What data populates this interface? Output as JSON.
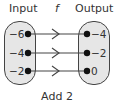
{
  "diagram": {
    "type": "mapping-diagram",
    "headers": {
      "input": "Input",
      "function": "f",
      "output": "Output"
    },
    "inputs": [
      "−6",
      "−4",
      "−2"
    ],
    "outputs": [
      "−4",
      "−2",
      "0"
    ],
    "mappings": [
      {
        "from": "−6",
        "to": "−4"
      },
      {
        "from": "−4",
        "to": "−2"
      },
      {
        "from": "−2",
        "to": "0"
      }
    ],
    "rule": "Add 2",
    "colors": {
      "oval_fill": "#e6e6e6",
      "stroke": "#444444",
      "text": "#333333"
    }
  }
}
